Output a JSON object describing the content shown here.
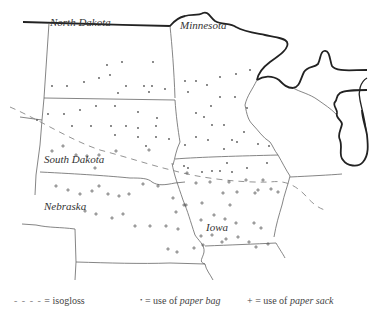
{
  "states": [
    {
      "name": "North Dakota",
      "x": 50,
      "y": 26
    },
    {
      "name": "Minnesota",
      "x": 180,
      "y": 29
    },
    {
      "name": "South Dakota",
      "x": 44,
      "y": 163
    },
    {
      "name": "Nebraska",
      "x": 44,
      "y": 210
    },
    {
      "name": "Iowa",
      "x": 206,
      "y": 231
    }
  ],
  "legend": {
    "isogloss_symbol": "- - - -",
    "isogloss_label": "= isogloss",
    "bag_symbol": "•",
    "bag_prefix": "= use of ",
    "bag_term": "paper bag",
    "sack_symbol": "+",
    "sack_prefix": "= use of ",
    "sack_term": "paper sack"
  },
  "colors": {
    "coast": "#222222",
    "border": "#666666",
    "isogloss": "#888888",
    "symbol": "#555555"
  },
  "bag_points": [
    [
      52,
      86
    ],
    [
      67,
      86
    ],
    [
      84,
      82
    ],
    [
      99,
      78
    ],
    [
      110,
      75
    ],
    [
      107,
      65
    ],
    [
      122,
      62
    ],
    [
      126,
      86
    ],
    [
      144,
      86
    ],
    [
      152,
      86
    ],
    [
      165,
      89
    ],
    [
      118,
      93
    ],
    [
      149,
      92
    ],
    [
      153,
      62
    ],
    [
      48,
      114
    ],
    [
      64,
      114
    ],
    [
      80,
      110
    ],
    [
      96,
      106
    ],
    [
      115,
      106
    ],
    [
      138,
      112
    ],
    [
      157,
      118
    ],
    [
      72,
      126
    ],
    [
      91,
      126
    ],
    [
      111,
      126
    ],
    [
      126,
      126
    ],
    [
      138,
      128
    ],
    [
      156,
      126
    ],
    [
      115,
      135
    ],
    [
      138,
      137
    ],
    [
      156,
      137
    ],
    [
      169,
      139
    ],
    [
      146,
      146
    ],
    [
      37,
      120
    ],
    [
      185,
      81
    ],
    [
      196,
      81
    ],
    [
      207,
      85
    ],
    [
      188,
      92
    ],
    [
      220,
      77
    ],
    [
      236,
      74
    ],
    [
      250,
      70
    ],
    [
      220,
      97
    ],
    [
      235,
      97
    ],
    [
      247,
      108
    ],
    [
      196,
      113
    ],
    [
      204,
      117
    ],
    [
      211,
      106
    ],
    [
      212,
      125
    ],
    [
      224,
      125
    ],
    [
      244,
      132
    ],
    [
      196,
      137
    ],
    [
      208,
      140
    ],
    [
      232,
      140
    ],
    [
      185,
      145
    ],
    [
      224,
      149
    ],
    [
      237,
      142
    ],
    [
      258,
      144
    ],
    [
      269,
      146
    ],
    [
      184,
      166
    ],
    [
      188,
      168
    ],
    [
      227,
      163
    ],
    [
      247,
      168
    ],
    [
      267,
      163
    ],
    [
      212,
      171
    ],
    [
      220,
      171
    ],
    [
      202,
      172
    ],
    [
      232,
      172
    ]
  ],
  "sack_points": [
    [
      52,
      151
    ],
    [
      63,
      146
    ],
    [
      76,
      155
    ],
    [
      87,
      156
    ],
    [
      99,
      155
    ],
    [
      116,
      151
    ],
    [
      149,
      150
    ],
    [
      95,
      168
    ],
    [
      187,
      173
    ],
    [
      196,
      183
    ],
    [
      246,
      180
    ],
    [
      229,
      182
    ],
    [
      210,
      182
    ],
    [
      263,
      180
    ],
    [
      258,
      190
    ],
    [
      271,
      189
    ],
    [
      278,
      192
    ],
    [
      202,
      203
    ],
    [
      186,
      205
    ],
    [
      176,
      212
    ],
    [
      223,
      193
    ],
    [
      237,
      192
    ],
    [
      255,
      193
    ],
    [
      230,
      205
    ],
    [
      56,
      186
    ],
    [
      68,
      190
    ],
    [
      80,
      194
    ],
    [
      92,
      191
    ],
    [
      99,
      186
    ],
    [
      108,
      194
    ],
    [
      119,
      196
    ],
    [
      129,
      194
    ],
    [
      143,
      184
    ],
    [
      158,
      186
    ],
    [
      173,
      198
    ],
    [
      184,
      205
    ],
    [
      85,
      211
    ],
    [
      96,
      214
    ],
    [
      112,
      218
    ],
    [
      123,
      214
    ],
    [
      135,
      226
    ],
    [
      150,
      226
    ],
    [
      166,
      226
    ],
    [
      178,
      229
    ],
    [
      201,
      220
    ],
    [
      214,
      215
    ],
    [
      225,
      219
    ],
    [
      236,
      223
    ],
    [
      254,
      223
    ],
    [
      261,
      228
    ],
    [
      201,
      236
    ],
    [
      212,
      235
    ],
    [
      222,
      242
    ],
    [
      238,
      237
    ],
    [
      249,
      242
    ],
    [
      268,
      244
    ],
    [
      177,
      252
    ],
    [
      194,
      248
    ],
    [
      203,
      245
    ],
    [
      226,
      239
    ],
    [
      256,
      247
    ],
    [
      168,
      249
    ]
  ]
}
